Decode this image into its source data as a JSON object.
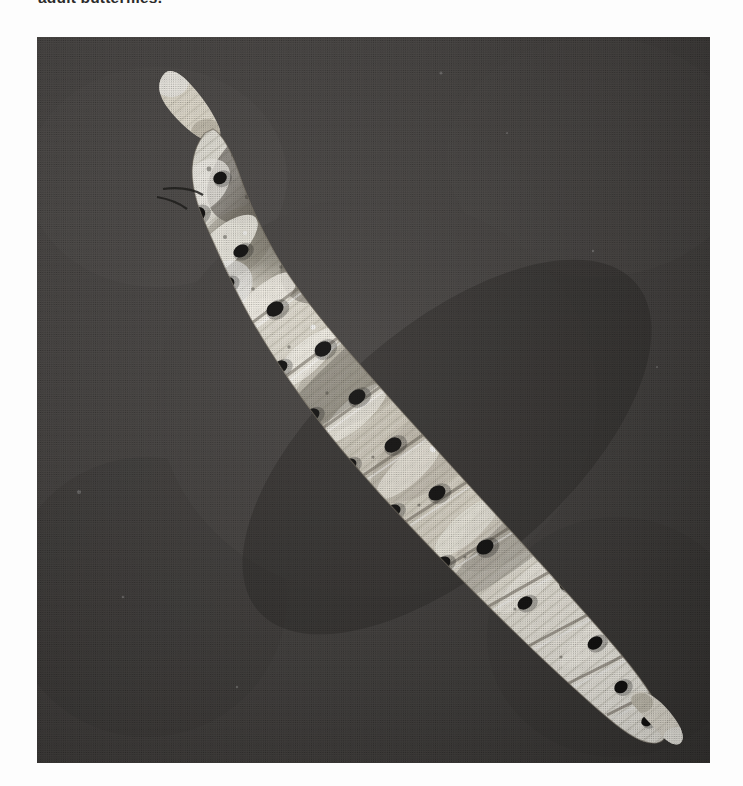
{
  "page": {
    "background_color": "#fdfdfd",
    "width": 743,
    "height": 786
  },
  "caption": {
    "text": "adult butterflies.",
    "color": "#2b2b2b",
    "clipped": "true"
  },
  "figure": {
    "type": "halftone-photograph",
    "orientation": "diagonal, head upper-left to cremaster lower-right",
    "background_color": "#4a4a4a",
    "body_highlight_color": "#f2efe6",
    "body_midtone_color": "#b9b4a6",
    "body_shadow_color": "#6f6a5e",
    "spot_color": "#1c1c1c",
    "border_color": "#3f3f3f",
    "x": 37,
    "y": 37,
    "width": 673,
    "height": 726
  },
  "body_spots": [
    {
      "cx": 206,
      "cy": 103,
      "rx": 10,
      "ry": 8,
      "rot": -38
    },
    {
      "cx": 236,
      "cy": 124,
      "rx": 12,
      "ry": 9,
      "rot": -40
    },
    {
      "cx": 268,
      "cy": 96,
      "rx": 9,
      "ry": 7,
      "rot": -35
    },
    {
      "cx": 183,
      "cy": 141,
      "rx": 7,
      "ry": 6,
      "rot": -30
    },
    {
      "cx": 160,
      "cy": 178,
      "rx": 9,
      "ry": 7,
      "rot": -42
    },
    {
      "cx": 204,
      "cy": 214,
      "rx": 8,
      "ry": 6,
      "rot": -30
    },
    {
      "cx": 252,
      "cy": 182,
      "rx": 13,
      "ry": 9,
      "rot": -42
    },
    {
      "cx": 300,
      "cy": 150,
      "rx": 10,
      "ry": 8,
      "rot": -45
    },
    {
      "cx": 340,
      "cy": 171,
      "rx": 8,
      "ry": 7,
      "rot": -38
    },
    {
      "cx": 318,
      "cy": 210,
      "rx": 9,
      "ry": 7,
      "rot": -36
    },
    {
      "cx": 277,
      "cy": 246,
      "rx": 11,
      "ry": 8,
      "rot": -40
    },
    {
      "cx": 238,
      "cy": 272,
      "rx": 9,
      "ry": 7,
      "rot": -33
    },
    {
      "cx": 190,
      "cy": 247,
      "rx": 8,
      "ry": 6,
      "rot": -35
    },
    {
      "cx": 148,
      "cy": 238,
      "rx": 7,
      "ry": 6,
      "rot": -30
    },
    {
      "cx": 356,
      "cy": 233,
      "rx": 8,
      "ry": 7,
      "rot": -40
    },
    {
      "cx": 392,
      "cy": 207,
      "rx": 7,
      "ry": 6,
      "rot": -38
    },
    {
      "cx": 330,
      "cy": 282,
      "rx": 10,
      "ry": 8,
      "rot": -38
    },
    {
      "cx": 286,
      "cy": 312,
      "rx": 9,
      "ry": 7,
      "rot": -35
    },
    {
      "cx": 243,
      "cy": 330,
      "rx": 8,
      "ry": 6,
      "rot": -32
    },
    {
      "cx": 200,
      "cy": 310,
      "rx": 7,
      "ry": 6,
      "rot": -30
    },
    {
      "cx": 380,
      "cy": 268,
      "rx": 8,
      "ry": 7,
      "rot": -40
    },
    {
      "cx": 420,
      "cy": 250,
      "rx": 7,
      "ry": 6,
      "rot": -38
    },
    {
      "cx": 404,
      "cy": 300,
      "rx": 9,
      "ry": 7,
      "rot": -38
    },
    {
      "cx": 366,
      "cy": 330,
      "rx": 8,
      "ry": 7,
      "rot": -35
    },
    {
      "cx": 320,
      "cy": 360,
      "rx": 9,
      "ry": 7,
      "rot": -34
    },
    {
      "cx": 275,
      "cy": 378,
      "rx": 8,
      "ry": 6,
      "rot": -32
    },
    {
      "cx": 232,
      "cy": 390,
      "rx": 7,
      "ry": 6,
      "rot": -30
    },
    {
      "cx": 446,
      "cy": 292,
      "rx": 8,
      "ry": 7,
      "rot": -40
    },
    {
      "cx": 470,
      "cy": 320,
      "rx": 8,
      "ry": 7,
      "rot": -38
    },
    {
      "cx": 440,
      "cy": 352,
      "rx": 9,
      "ry": 7,
      "rot": -36
    },
    {
      "cx": 400,
      "cy": 382,
      "rx": 8,
      "ry": 7,
      "rot": -35
    },
    {
      "cx": 356,
      "cy": 408,
      "rx": 9,
      "ry": 7,
      "rot": -33
    },
    {
      "cx": 312,
      "cy": 428,
      "rx": 8,
      "ry": 6,
      "rot": -31
    },
    {
      "cx": 268,
      "cy": 440,
      "rx": 7,
      "ry": 6,
      "rot": -30
    },
    {
      "cx": 498,
      "cy": 348,
      "rx": 8,
      "ry": 7,
      "rot": -40
    },
    {
      "cx": 520,
      "cy": 378,
      "rx": 8,
      "ry": 7,
      "rot": -38
    },
    {
      "cx": 486,
      "cy": 404,
      "rx": 9,
      "ry": 7,
      "rot": -36
    },
    {
      "cx": 444,
      "cy": 432,
      "rx": 8,
      "ry": 7,
      "rot": -34
    },
    {
      "cx": 400,
      "cy": 456,
      "rx": 9,
      "ry": 7,
      "rot": -32
    },
    {
      "cx": 356,
      "cy": 474,
      "rx": 8,
      "ry": 6,
      "rot": -31
    },
    {
      "cx": 316,
      "cy": 486,
      "rx": 7,
      "ry": 6,
      "rot": -30
    },
    {
      "cx": 546,
      "cy": 406,
      "rx": 8,
      "ry": 7,
      "rot": -40
    },
    {
      "cx": 566,
      "cy": 438,
      "rx": 8,
      "ry": 7,
      "rot": -38
    },
    {
      "cx": 532,
      "cy": 462,
      "rx": 9,
      "ry": 7,
      "rot": -36
    },
    {
      "cx": 490,
      "cy": 488,
      "rx": 8,
      "ry": 7,
      "rot": -34
    },
    {
      "cx": 448,
      "cy": 510,
      "rx": 9,
      "ry": 7,
      "rot": -32
    },
    {
      "cx": 406,
      "cy": 526,
      "rx": 8,
      "ry": 6,
      "rot": -31
    },
    {
      "cx": 588,
      "cy": 466,
      "rx": 8,
      "ry": 7,
      "rot": -40
    },
    {
      "cx": 604,
      "cy": 500,
      "rx": 8,
      "ry": 7,
      "rot": -38
    },
    {
      "cx": 570,
      "cy": 522,
      "rx": 9,
      "ry": 7,
      "rot": -36
    },
    {
      "cx": 530,
      "cy": 546,
      "rx": 8,
      "ry": 7,
      "rot": -34
    },
    {
      "cx": 488,
      "cy": 566,
      "rx": 8,
      "ry": 6,
      "rot": -32
    },
    {
      "cx": 618,
      "cy": 536,
      "rx": 8,
      "ry": 7,
      "rot": -40
    },
    {
      "cx": 630,
      "cy": 568,
      "rx": 8,
      "ry": 7,
      "rot": -38
    },
    {
      "cx": 596,
      "cy": 588,
      "rx": 8,
      "ry": 7,
      "rot": -36
    },
    {
      "cx": 558,
      "cy": 606,
      "rx": 8,
      "ry": 6,
      "rot": -34
    },
    {
      "cx": 640,
      "cy": 604,
      "rx": 7,
      "ry": 6,
      "rot": -38
    },
    {
      "cx": 614,
      "cy": 632,
      "rx": 8,
      "ry": 6,
      "rot": -36
    },
    {
      "cx": 584,
      "cy": 650,
      "rx": 7,
      "ry": 6,
      "rot": -34
    },
    {
      "cx": 636,
      "cy": 662,
      "rx": 7,
      "ry": 6,
      "rot": -36
    },
    {
      "cx": 610,
      "cy": 684,
      "rx": 6,
      "ry": 5,
      "rot": -34
    }
  ],
  "segment_lines": [
    {
      "x1": 196,
      "y1": 300,
      "x2": 330,
      "y2": 200
    },
    {
      "x1": 232,
      "y1": 352,
      "x2": 372,
      "y2": 248
    },
    {
      "x1": 268,
      "y1": 404,
      "x2": 418,
      "y2": 296
    },
    {
      "x1": 306,
      "y1": 452,
      "x2": 466,
      "y2": 344
    },
    {
      "x1": 348,
      "y1": 498,
      "x2": 512,
      "y2": 392
    },
    {
      "x1": 392,
      "y1": 540,
      "x2": 556,
      "y2": 440
    },
    {
      "x1": 436,
      "y1": 578,
      "x2": 596,
      "y2": 488
    },
    {
      "x1": 482,
      "y1": 614,
      "x2": 630,
      "y2": 536
    },
    {
      "x1": 528,
      "y1": 648,
      "x2": 656,
      "y2": 584
    },
    {
      "x1": 570,
      "y1": 678,
      "x2": 670,
      "y2": 628
    }
  ]
}
